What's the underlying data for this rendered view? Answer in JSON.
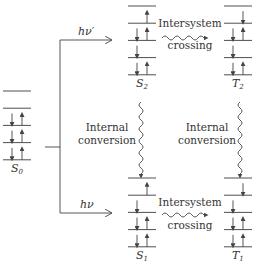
{
  "diagram": {
    "states": [
      {
        "id": "S0",
        "label": "S",
        "sub": "0",
        "x": 3,
        "top": 91,
        "levels": [
          [],
          [],
          [
            "down",
            "up"
          ],
          [
            "down",
            "up"
          ],
          [
            "down",
            "up"
          ]
        ]
      },
      {
        "id": "S2",
        "label": "S",
        "sub": "2",
        "x": 128,
        "top": 6,
        "levels": [
          [],
          [
            "up"
          ],
          [
            "down",
            "up"
          ],
          [
            "down"
          ],
          [
            "down",
            "up"
          ]
        ]
      },
      {
        "id": "T2",
        "label": "T",
        "sub": "2",
        "x": 224,
        "top": 6,
        "levels": [
          [],
          [
            "down-r"
          ],
          [
            "down",
            "up"
          ],
          [
            "down"
          ],
          [
            "down",
            "up"
          ]
        ]
      },
      {
        "id": "S1",
        "label": "S",
        "sub": "1",
        "x": 128,
        "top": 178,
        "levels": [
          [],
          [
            "up"
          ],
          [
            "down"
          ],
          [
            "down",
            "up"
          ],
          [
            "down",
            "up"
          ]
        ]
      },
      {
        "id": "T1",
        "label": "T",
        "sub": "1",
        "x": 224,
        "top": 178,
        "levels": [
          [],
          [
            "down-r"
          ],
          [
            "down"
          ],
          [
            "down",
            "up"
          ],
          [
            "down",
            "up"
          ]
        ]
      }
    ],
    "transitions": {
      "excitation_upper": {
        "label": "hν′"
      },
      "excitation_lower": {
        "label": "hν"
      },
      "isc_upper": {
        "line1": "Intersystem",
        "line2": "crossing"
      },
      "isc_lower": {
        "line1": "Intersystem",
        "line2": "crossing"
      },
      "ic_left": {
        "line1": "Internal",
        "line2": "conversion"
      },
      "ic_right": {
        "line1": "Internal",
        "line2": "conversion"
      }
    },
    "labels": {
      "S0": "S",
      "S0_sub": "0",
      "S1": "S",
      "S1_sub": "1",
      "S2": "S",
      "S2_sub": "2",
      "T1": "T",
      "T1_sub": "1",
      "T2": "T",
      "T2_sub": "2"
    }
  }
}
